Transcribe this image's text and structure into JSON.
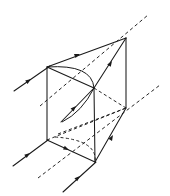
{
  "figure": {
    "background_color": "#ffffff",
    "line_color": "#1a1a1a",
    "width": 170,
    "height": 196
  },
  "geometry": {
    "vertices": {
      "top_back_left": [
        47,
        67
      ],
      "top_apex_right": [
        126,
        38
      ],
      "top_front_mid": [
        94,
        88
      ],
      "bottom_back_left": [
        47,
        140
      ],
      "bottom_front_mid": [
        95,
        162
      ],
      "right_lower": [
        126,
        108
      ],
      "top_hidden_back": [
        79,
        49
      ],
      "bottom_hidden": [
        79,
        122
      ]
    },
    "solid_edges": [
      {
        "name": "top-back-left-to-apex",
        "from": [
          47,
          67
        ],
        "to": [
          126,
          38
        ]
      },
      {
        "name": "top-back-left-to-front-mid",
        "from": [
          47,
          67
        ],
        "to": [
          94,
          88
        ]
      },
      {
        "name": "apex-to-front-mid",
        "from": [
          126,
          38
        ],
        "to": [
          94,
          88
        ]
      },
      {
        "name": "left-vertical",
        "from": [
          47,
          67
        ],
        "to": [
          47,
          140
        ]
      },
      {
        "name": "front-mid-vertical",
        "from": [
          94,
          88
        ],
        "to": [
          95,
          162
        ]
      },
      {
        "name": "apex-vertical-right",
        "from": [
          126,
          38
        ],
        "to": [
          126,
          108
        ]
      },
      {
        "name": "bottom-back-left-to-front-mid",
        "from": [
          47,
          140
        ],
        "to": [
          95,
          162
        ]
      },
      {
        "name": "bottom-front-mid-to-right",
        "from": [
          95,
          162
        ],
        "to": [
          126,
          108
        ]
      }
    ],
    "hidden_edges": [
      {
        "name": "bottom-left-to-right-lower",
        "from": [
          47,
          140
        ],
        "to": [
          126,
          108
        ]
      },
      {
        "name": "front-mid-to-right-lower",
        "from": [
          94,
          88
        ],
        "to": [
          126,
          108
        ]
      },
      {
        "name": "bottom-hidden-diagonal",
        "from": [
          60,
          133
        ],
        "to": [
          126,
          108
        ]
      }
    ],
    "arcs": [
      {
        "name": "top-face-arc",
        "style": "solid",
        "start": [
          47,
          67
        ],
        "control": [
          92,
          64
        ],
        "end": [
          94,
          88
        ]
      },
      {
        "name": "front-face-arc",
        "style": "solid",
        "start": [
          94,
          88
        ],
        "control": [
          82,
          112
        ],
        "end": [
          62,
          122
        ]
      },
      {
        "name": "bottom-face-arc",
        "style": "dashed",
        "start": [
          55,
          137
        ],
        "control": [
          98,
          140
        ],
        "end": [
          95,
          162
        ]
      }
    ],
    "rays": [
      {
        "name": "incident-ray-upper-left",
        "style": "solid",
        "from": [
          14,
          91
        ],
        "to": [
          50,
          66
        ],
        "arrow_at": [
          30,
          80
        ],
        "arrow_angle": -34.8
      },
      {
        "name": "top-face-ray",
        "style": "solid",
        "from": [
          47,
          67
        ],
        "to": [
          126,
          38
        ],
        "arrow_at": [
          80,
          54
        ],
        "arrow_angle": -20.2
      },
      {
        "name": "internal-ray-to-apex",
        "style": "solid",
        "from": [
          94,
          88
        ],
        "to": [
          126,
          38
        ],
        "arrow_at": [
          112,
          61
        ],
        "arrow_angle": -57.4
      },
      {
        "name": "dashed-axis-upper",
        "style": "dashed",
        "from": [
          40,
          106
        ],
        "to": [
          148,
          15
        ],
        "arrow_at": [
          null,
          null
        ],
        "arrow_angle": 0
      },
      {
        "name": "internal-ray-lower-left",
        "style": "solid",
        "from": [
          61,
          122
        ],
        "to": [
          94,
          88
        ],
        "arrow_at": [
          76,
          106
        ],
        "arrow_angle": -45.8
      },
      {
        "name": "incident-ray-lower-left",
        "style": "solid",
        "from": [
          13,
          166
        ],
        "to": [
          48,
          140
        ],
        "arrow_at": [
          29,
          154
        ],
        "arrow_angle": -36.6
      },
      {
        "name": "bottom-face-ray",
        "style": "solid",
        "from": [
          47,
          140
        ],
        "to": [
          95,
          162
        ],
        "arrow_at": [
          69,
          150
        ],
        "arrow_angle": 24.6
      },
      {
        "name": "exit-ray-lower-right",
        "style": "solid",
        "from": [
          95,
          162
        ],
        "to": [
          126,
          108
        ],
        "arrow_at": [
          113,
          135
        ],
        "arrow_angle": -60.1
      },
      {
        "name": "incident-ray-bottom",
        "style": "solid",
        "from": [
          63,
          192
        ],
        "to": [
          96,
          162
        ],
        "arrow_at": [
          78,
          178
        ],
        "arrow_angle": -42.2
      },
      {
        "name": "dashed-axis-lower",
        "style": "dashed",
        "from": [
          38,
          178
        ],
        "to": [
          160,
          85
        ],
        "arrow_at": [
          null,
          null
        ],
        "arrow_angle": 0
      }
    ]
  }
}
